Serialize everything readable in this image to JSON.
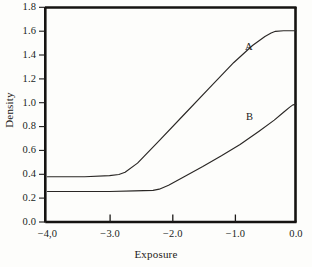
{
  "chart_data": {
    "type": "line",
    "title": "",
    "subtitle": "",
    "xlabel": "Exposure",
    "ylabel": "Density",
    "xlim": [
      -4.0,
      0.0
    ],
    "ylim": [
      0.0,
      1.9
    ],
    "grid": false,
    "legend_position": "inline-annotation",
    "x_ticks": [
      -4.0,
      -3.0,
      -2.0,
      -1.0,
      0.0
    ],
    "x_tick_labels": [
      "−4,0",
      "−3.0",
      "−2.0",
      "−1.0",
      "0.0"
    ],
    "y_ticks": [
      0.0,
      0.2,
      0.4,
      0.6,
      0.8,
      1.0,
      1.2,
      1.4,
      1.6,
      1.8
    ],
    "y_tick_labels": [
      "0.0",
      "0.2",
      "0.4",
      "0.6",
      "0.8",
      "1.0",
      "1.2",
      "1.4",
      "1.6",
      "1.8"
    ],
    "series": [
      {
        "name": "A",
        "annotation": "A",
        "base_density": 0.4,
        "max_density": 1.69,
        "toe_x": -2.75,
        "shoulder_x": -0.35,
        "color": "#2a2725",
        "x": [
          -4.0,
          -3.4,
          -3.0,
          -2.85,
          -2.75,
          -2.55,
          -2.2,
          -1.8,
          -1.4,
          -1.0,
          -0.7,
          -0.5,
          -0.4,
          -0.33,
          -0.2,
          -0.1,
          0.0
        ],
        "values": [
          0.4,
          0.4,
          0.41,
          0.42,
          0.44,
          0.52,
          0.72,
          0.95,
          1.18,
          1.41,
          1.56,
          1.64,
          1.67,
          1.685,
          1.69,
          1.69,
          1.69
        ]
      },
      {
        "name": "B",
        "annotation": "B",
        "base_density": 0.27,
        "max_density": 1.04,
        "toe_x": -2.2,
        "shoulder_x": -0.05,
        "color": "#2a2725",
        "x": [
          -4.0,
          -3.4,
          -3.0,
          -2.6,
          -2.3,
          -2.2,
          -2.05,
          -1.8,
          -1.5,
          -1.2,
          -0.9,
          -0.6,
          -0.35,
          -0.2,
          -0.1,
          -0.05,
          0.0
        ],
        "values": [
          0.27,
          0.27,
          0.27,
          0.275,
          0.28,
          0.29,
          0.325,
          0.4,
          0.49,
          0.585,
          0.685,
          0.8,
          0.9,
          0.97,
          1.015,
          1.035,
          1.04
        ]
      }
    ]
  },
  "axes": {
    "x_title": "Exposure",
    "y_title": "Density"
  },
  "annotations": {
    "curve_a": "A",
    "curve_b": "B"
  },
  "style": {
    "frame_color": "#151311",
    "curve_color": "#2a2725",
    "text_color": "#1d1b19",
    "background": "#fdfdfb"
  }
}
